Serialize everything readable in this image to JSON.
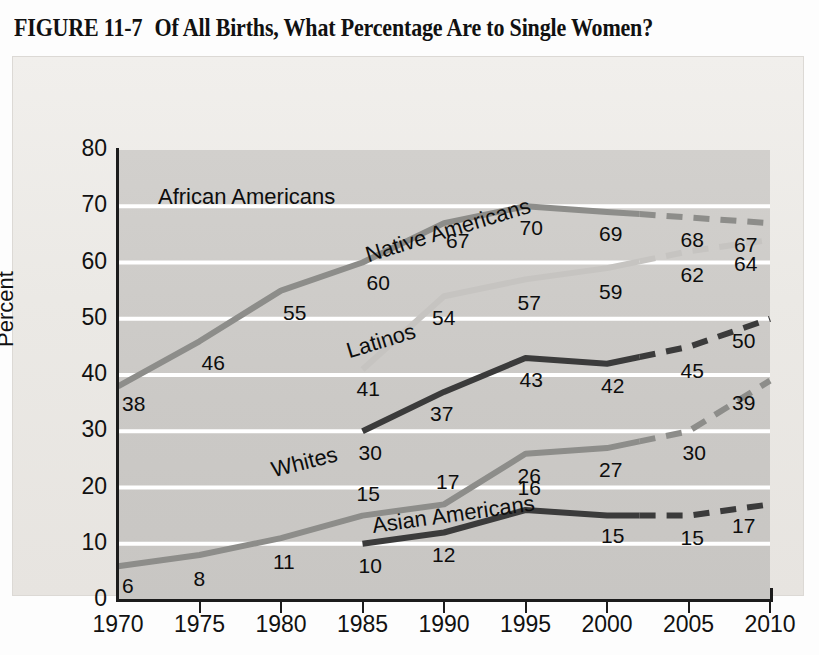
{
  "figure": {
    "number": "FIGURE 11-7",
    "title": "Of All Births, What Percentage Are to Single Women?"
  },
  "axes": {
    "y_title": "Percent",
    "x_title": "Year",
    "y_ticks": [
      "80",
      "70",
      "60",
      "50",
      "40",
      "30",
      "20",
      "10",
      "0"
    ],
    "x_ticks": [
      "1970",
      "1975",
      "1980",
      "1985",
      "1990",
      "1995",
      "2000",
      "2005",
      "2010"
    ]
  },
  "series_labels": {
    "african_americans": "African Americans",
    "native_americans": "Native Americans",
    "latinos": "Latinos",
    "whites": "Whites",
    "asian_americans": "Asian Americans"
  },
  "colors": {
    "plot_background": "#cdcbc8",
    "panel_background": "#eceae7",
    "gridline": "#ffffff",
    "axis": "#1c1c1c",
    "african_americans": "#8d8d8a",
    "native_americans": "#c6c4c1",
    "latinos": "#3b3b3b",
    "whites": "#8d8d8a",
    "asian_americans": "#3b3b3b"
  },
  "chart_data": {
    "type": "line",
    "title": "Of All Births, What Percentage Are to Single Women?",
    "xlabel": "Year",
    "ylabel": "Percent",
    "xlim": [
      1970,
      2010
    ],
    "ylim": [
      0,
      80
    ],
    "grid": true,
    "legend": "inline-labels",
    "x": [
      1970,
      1975,
      1980,
      1985,
      1990,
      1995,
      2000,
      2005,
      2010
    ],
    "projection_starts_year": 2002,
    "note": "Segments after 2002 are drawn dashed to indicate projected values.",
    "series": [
      {
        "name": "African Americans",
        "color": "#8d8d8a",
        "x": [
          1970,
          1975,
          1980,
          1985,
          1990,
          1995,
          2000,
          2005,
          2010
        ],
        "values": [
          38,
          46,
          55,
          60,
          67,
          70,
          69,
          68,
          67
        ],
        "labels": [
          "38",
          "46",
          "55",
          "60",
          "67",
          "70",
          "69",
          "68",
          "67"
        ]
      },
      {
        "name": "Native Americans",
        "color": "#c6c4c1",
        "x": [
          1985,
          1990,
          1995,
          2000,
          2005,
          2010
        ],
        "values": [
          41,
          54,
          57,
          59,
          62,
          64
        ],
        "labels": [
          "41",
          "54",
          "57",
          "59",
          "62",
          "64"
        ]
      },
      {
        "name": "Latinos",
        "color": "#3b3b3b",
        "x": [
          1985,
          1990,
          1995,
          2000,
          2005,
          2010
        ],
        "values": [
          30,
          37,
          43,
          42,
          45,
          50
        ],
        "labels": [
          "30",
          "37",
          "43",
          "42",
          "45",
          "50"
        ]
      },
      {
        "name": "Whites",
        "color": "#8d8d8a",
        "x": [
          1970,
          1975,
          1980,
          1985,
          1990,
          1995,
          2000,
          2005,
          2010
        ],
        "values": [
          6,
          8,
          11,
          15,
          17,
          26,
          27,
          30,
          39
        ],
        "labels": [
          "6",
          "8",
          "11",
          "15",
          "17",
          "26",
          "27",
          "30",
          "39"
        ]
      },
      {
        "name": "Asian Americans",
        "color": "#3b3b3b",
        "x": [
          1985,
          1990,
          1995,
          2000,
          2005,
          2010
        ],
        "values": [
          10,
          12,
          16,
          15,
          15,
          17
        ],
        "labels": [
          "10",
          "12",
          "16",
          "15",
          "15",
          "17"
        ]
      }
    ]
  },
  "value_labels": {
    "aa_1970": "38",
    "aa_1975": "46",
    "aa_1980": "55",
    "aa_1985": "60",
    "aa_1990": "67",
    "aa_1995": "70",
    "aa_2000": "69",
    "aa_2005": "68",
    "aa_2010": "67",
    "na_1985": "41",
    "na_1990": "54",
    "na_1995": "57",
    "na_2000": "59",
    "na_2005": "62",
    "na_2010": "64",
    "la_1985": "30",
    "la_1990": "37",
    "la_1995": "43",
    "la_2000": "42",
    "la_2005": "45",
    "la_2010": "50",
    "wh_1970": "6",
    "wh_1975": "8",
    "wh_1980": "11",
    "wh_1985": "15",
    "wh_1990": "17",
    "wh_1995": "26",
    "wh_2000": "27",
    "wh_2005": "30",
    "wh_2010": "39",
    "as_1985": "10",
    "as_1990": "12",
    "as_1995": "16",
    "as_2000": "15",
    "as_2005": "15",
    "as_2010": "17"
  }
}
